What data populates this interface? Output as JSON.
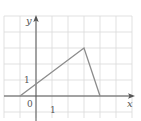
{
  "diagram": {
    "type": "coordinate-graph",
    "axes": {
      "x_label": "x",
      "y_label": "y",
      "origin_label": "0",
      "x_tick_label": "1",
      "y_tick_label": "1"
    },
    "grid": {
      "spacing_units": 1,
      "visible": true
    },
    "polyline": {
      "points": [
        [
          -1,
          0
        ],
        [
          3,
          3
        ],
        [
          4,
          0
        ]
      ],
      "description": "Piecewise linear graph: from (-1,0) up to (3,3), then down to (4,0)"
    },
    "colors": {
      "grid": "#d9d9d9",
      "axes": "#555555",
      "graph_line": "#8c8c8c",
      "text": "#555555",
      "background": "#ffffff"
    }
  }
}
